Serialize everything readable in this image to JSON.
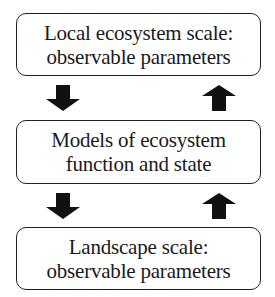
{
  "diagram": {
    "boxes": [
      {
        "line1": "Local ecosystem scale:",
        "line2": "observable parameters"
      },
      {
        "line1": "Models of ecosystem",
        "line2": "function and state"
      },
      {
        "line1": "Landscape scale:",
        "line2": "observable parameters"
      }
    ],
    "arrows": [
      {
        "direction": "down",
        "from": "Local ecosystem scale",
        "to": "Models"
      },
      {
        "direction": "up",
        "from": "Models",
        "to": "Local ecosystem scale"
      },
      {
        "direction": "down",
        "from": "Models",
        "to": "Landscape scale"
      },
      {
        "direction": "up",
        "from": "Landscape scale",
        "to": "Models"
      }
    ],
    "colors": {
      "stroke": "#222222",
      "arrow_fill": "#111111",
      "background": "#ffffff"
    }
  }
}
